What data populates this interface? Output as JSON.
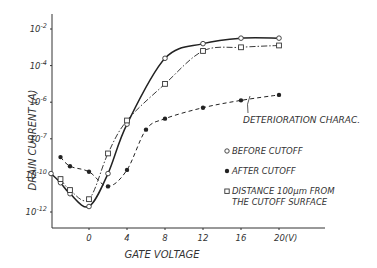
{
  "chart_data": {
    "type": "line",
    "title": "",
    "xlabel": "GATE VOLTAGE",
    "ylabel": "DRAIN CURRENT (A)",
    "x_unit_label": "20(V)",
    "xticks": [
      "0",
      "4",
      "8",
      "12",
      "16",
      "20(V)"
    ],
    "xtick_values": [
      0,
      4,
      8,
      12,
      16,
      20
    ],
    "yticks": [
      "10-2",
      "10-4",
      "10-6",
      "10-7",
      "10-10",
      "10-12"
    ],
    "ytick_exponents": [
      -2,
      -4,
      -6,
      -8,
      -10,
      -12
    ],
    "xlim": [
      -4,
      21
    ],
    "ylim_exponent": [
      -13.5,
      -1
    ],
    "yscale": "log",
    "grid": false,
    "legend_position": "right-middle",
    "annotation": "DETERIORATION CHARAC.",
    "series": [
      {
        "name": "BEFORE CUTOFF",
        "marker": "open-circle",
        "line": "solid",
        "x": [
          -4,
          -3,
          -2,
          0,
          2,
          4,
          8,
          12,
          16,
          20
        ],
        "log10_y": [
          -9.9,
          -10.4,
          -11.0,
          -11.7,
          -9.9,
          -7.2,
          -3.6,
          -2.8,
          -2.5,
          -2.5
        ]
      },
      {
        "name": "AFTER CUTOFF",
        "marker": "filled-circle",
        "line": "dashed",
        "x": [
          -3,
          -2,
          0,
          2,
          4,
          6,
          8,
          12,
          16,
          20
        ],
        "log10_y": [
          -9.0,
          -9.5,
          -9.8,
          -10.6,
          -9.7,
          -7.5,
          -6.9,
          -6.3,
          -5.9,
          -5.6
        ]
      },
      {
        "name": "DISTANCE 100μm FROM THE CUTOFF SURFACE",
        "marker": "open-square",
        "line": "dash-dot",
        "x": [
          -3,
          -2,
          0,
          2,
          4,
          8,
          12,
          16,
          20
        ],
        "log10_y": [
          -10.2,
          -10.8,
          -11.3,
          -8.8,
          -7.0,
          -5.0,
          -3.2,
          -3.0,
          -2.9
        ]
      }
    ]
  },
  "legend": {
    "before": "BEFORE CUTOFF",
    "after": "AFTER CUTOFF",
    "distance_line1": "DISTANCE 100μm FROM",
    "distance_line2": "THE CUTOFF SURFACE"
  }
}
